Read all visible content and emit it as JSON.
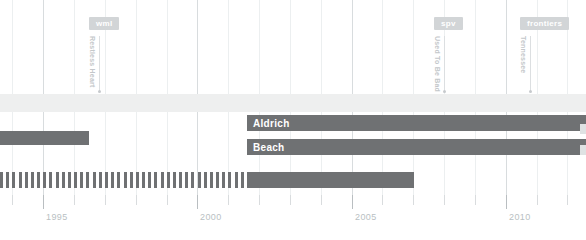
{
  "chart_data": {
    "type": "bar",
    "title": "",
    "subtitle": "",
    "xlabel": "",
    "ylabel": "",
    "orientation": "horizontal",
    "grid": true,
    "legend_position": "none",
    "xlim": [
      1993.6,
      2012.6
    ],
    "x_tick_labels": [
      "1995",
      "2000",
      "2005",
      "2010"
    ],
    "x_tick_values": [
      1995,
      2000,
      2005,
      2010
    ],
    "x_minor_step": 1,
    "colors": {
      "bar": "#6f7173",
      "band": "#eeefef",
      "gridline": "#eceff0",
      "gridline_major": "#d8dcde",
      "axis_text": "#b9bfc3",
      "badge": "#d2d5d7",
      "bar_label": "#ffffff"
    },
    "series": [
      {
        "name": "Aldrich",
        "label": "Aldrich",
        "row": 1,
        "start": 2001.6,
        "end": 2012.6,
        "style": "solid"
      },
      {
        "name": "Beach",
        "label": "Beach",
        "row": 2,
        "start": 2001.6,
        "end": 2012.6,
        "style": "solid"
      },
      {
        "name": "unlabeled-upper",
        "label": "",
        "row": 0,
        "start": 1993.6,
        "end": 1996.5,
        "style": "solid"
      },
      {
        "name": "unlabeled-lower-dashed",
        "label": "",
        "row": 3,
        "start": 1993.6,
        "end": 2001.6,
        "style": "dashed",
        "dash_count": 40
      },
      {
        "name": "unlabeled-lower-solid",
        "label": "",
        "row": 3,
        "start": 2001.6,
        "end": 2007.0,
        "style": "solid"
      }
    ],
    "era_band": {
      "label": "",
      "start": 1993.6,
      "end": 2012.6
    },
    "events": [
      {
        "badge": "wml",
        "title": "Restless Heart",
        "x": 1996.8
      },
      {
        "badge": "spv",
        "title": "Used To Be Bad",
        "x": 2008.0
      },
      {
        "badge": "frontiers",
        "title": "Tennessee",
        "x": 2010.8
      }
    ]
  }
}
